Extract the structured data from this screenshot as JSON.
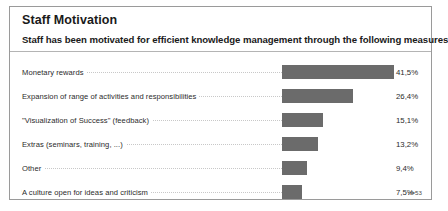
{
  "panel": {
    "title": "Staff Motivation",
    "subtitle": "Staff has been motivated for efficient knowledge management through the following measures",
    "copyright": "© Fraunhofer IPK 2000",
    "sample_size": "n=53"
  },
  "colors": {
    "bar_fill": "#6b6b6b",
    "border": "#9a9a9a",
    "rule": "#b4b4b4",
    "leader": "#c8c8c8",
    "text": "#2b2b2b",
    "background": "#ffffff"
  },
  "chart_data": {
    "type": "bar",
    "orientation": "horizontal",
    "title": "Staff Motivation",
    "subtitle": "Staff has been motivated for efficient knowledge management through the following measures",
    "xlabel": "",
    "ylabel": "",
    "xlim": [
      0,
      45
    ],
    "grid": false,
    "legend": false,
    "value_suffix": "%",
    "decimal_separator": ",",
    "sample_size": "n=53",
    "categories": [
      "Monetary rewards",
      "Expansion of range of activities and responsibilities",
      "\"Visualization of Success\" (feedback)",
      "Extras (seminars, training, ...)",
      "Other",
      "A culture open for ideas and criticism"
    ],
    "values": [
      41.5,
      26.4,
      15.1,
      13.2,
      9.4,
      7.5
    ],
    "value_labels": [
      "41,5%",
      "26,4%",
      "15,1%",
      "13,2%",
      "9,4%",
      "7,5%"
    ]
  }
}
